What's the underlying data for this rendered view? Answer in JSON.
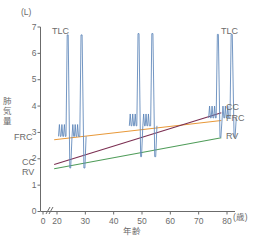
{
  "chart_data": {
    "type": "line",
    "title": "",
    "xlabel": "年齢",
    "xunit": "(歳)",
    "ylabel": "肺気量",
    "yunit": "(L)",
    "xlim": [
      16,
      84
    ],
    "ylim": [
      0,
      7
    ],
    "xticks": [
      0,
      20,
      30,
      40,
      50,
      60,
      70,
      80
    ],
    "yticks": [
      0,
      1,
      2,
      3,
      4,
      5,
      6,
      7
    ],
    "grid": false,
    "legend": "none",
    "axis_break": true,
    "series": [
      {
        "name": "FRC",
        "color": "#e8993a",
        "x": [
          19,
          78
        ],
        "values": [
          2.72,
          3.45
        ]
      },
      {
        "name": "CC",
        "color": "#7b2f52",
        "x": [
          19,
          78
        ],
        "values": [
          1.78,
          3.75
        ]
      },
      {
        "name": "RV",
        "color": "#4f9c59",
        "x": [
          19,
          78
        ],
        "values": [
          1.62,
          2.8
        ]
      }
    ],
    "spirograms": {
      "color": "#5b84b8",
      "traces": [
        {
          "age": 23,
          "TLC": 6.7,
          "FRC": 2.85,
          "RV": 1.65
        },
        {
          "age": 48,
          "TLC": 6.75,
          "FRC": 3.25,
          "RV": 2.08
        },
        {
          "age": 76,
          "TLC": 6.72,
          "FRC": 3.55,
          "RV": 2.82
        }
      ]
    },
    "annotations": [
      {
        "text": "TLC",
        "x": 21,
        "y": 6.55,
        "side": "left"
      },
      {
        "text": "TLC",
        "x": 79,
        "y": 6.55,
        "side": "right"
      },
      {
        "text": "FRC",
        "x": 17,
        "y": 2.72,
        "side": "left"
      },
      {
        "text": "CC",
        "x": 17.5,
        "y": 1.82,
        "side": "left"
      },
      {
        "text": "RV",
        "x": 17.5,
        "y": 1.5,
        "side": "left"
      },
      {
        "text": "CC",
        "x": 80,
        "y": 3.78,
        "side": "right"
      },
      {
        "text": "FRC",
        "x": 80,
        "y": 3.42,
        "side": "right"
      },
      {
        "text": "RV",
        "x": 80,
        "y": 2.8,
        "side": "right"
      }
    ]
  },
  "axis": {
    "y_unit_label": "(L)",
    "y_title_chars": [
      "肺",
      "気",
      "量"
    ],
    "x_title": "年齢",
    "x_unit_label": "(歳)",
    "x_tick_labels": [
      "0",
      "20",
      "30",
      "40",
      "50",
      "60",
      "70",
      "80"
    ],
    "y_tick_labels": [
      "0",
      "1",
      "2",
      "3",
      "4",
      "5",
      "6",
      "7"
    ]
  },
  "labels": {
    "tlc_left": "TLC",
    "tlc_right": "TLC",
    "frc_left": "FRC",
    "cc_left": "CC",
    "rv_left": "RV",
    "cc_right": "CC",
    "frc_right": "FRC",
    "rv_right": "RV"
  }
}
